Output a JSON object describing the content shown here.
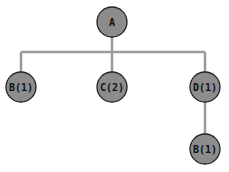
{
  "diagram": {
    "type": "tree",
    "colors": {
      "node_fill": "#8c8c8c",
      "node_stroke": "#222222",
      "edge": "#9a9a9a",
      "background": "#ffffff"
    },
    "nodes": [
      {
        "id": "A",
        "label": "A",
        "x": 112,
        "y": 22
      },
      {
        "id": "B1",
        "label": "B(1)",
        "x": 21,
        "y": 87
      },
      {
        "id": "C2",
        "label": "C(2)",
        "x": 112,
        "y": 87
      },
      {
        "id": "D1",
        "label": "D(1)",
        "x": 205,
        "y": 87
      },
      {
        "id": "B1b",
        "label": "B(1)",
        "x": 205,
        "y": 149
      }
    ],
    "edges": [
      {
        "from": "A",
        "to": "B1"
      },
      {
        "from": "A",
        "to": "C2"
      },
      {
        "from": "A",
        "to": "D1"
      },
      {
        "from": "D1",
        "to": "B1b"
      }
    ]
  }
}
